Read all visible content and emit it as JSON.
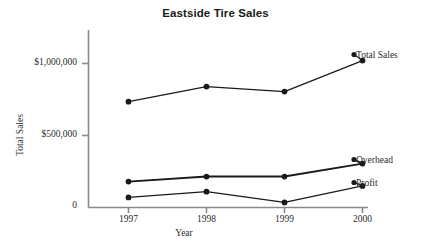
{
  "chart_data": {
    "type": "line",
    "title": "Eastside Tire Sales",
    "xlabel": "Year",
    "ylabel": "Total Sales",
    "categories": [
      "1997",
      "1998",
      "1999",
      "2000"
    ],
    "x": [
      1997,
      1998,
      1999,
      2000
    ],
    "ylim": [
      0,
      1150000
    ],
    "xlim": [
      1996.5,
      2000.4
    ],
    "yticks": [
      0,
      500000,
      1000000
    ],
    "ytick_labels": [
      "0",
      "$500,000",
      "$1,000,000"
    ],
    "grid": false,
    "legend_position": "right-inline-labels",
    "series": [
      {
        "name": "Total Sales",
        "values": [
          735000,
          840000,
          805000,
          1020000
        ],
        "color": "#1a1a1a",
        "line_width": 1.2,
        "marker": "filled-circle"
      },
      {
        "name": "Overhead",
        "values": [
          180000,
          215000,
          215000,
          305000
        ],
        "color": "#1a1a1a",
        "line_width": 1.9,
        "marker": "filled-circle"
      },
      {
        "name": "Profit",
        "values": [
          70000,
          110000,
          35000,
          150000
        ],
        "color": "#1a1a1a",
        "line_width": 1.2,
        "marker": "filled-circle"
      }
    ]
  },
  "title": "Eastside Tire Sales",
  "axes": {
    "y_title": "Total Sales",
    "x_title": "Year",
    "y_ticks": [
      {
        "label": "$1,000,000",
        "value": 1000000
      },
      {
        "label": "$500,000",
        "value": 500000
      },
      {
        "label": "0",
        "value": 0
      }
    ],
    "x_ticks": [
      {
        "label": "1997"
      },
      {
        "label": "1998"
      },
      {
        "label": "1999"
      },
      {
        "label": "2000"
      }
    ]
  },
  "series_labels": [
    {
      "label": "Total Sales"
    },
    {
      "label": "Overhead"
    },
    {
      "label": "Profit"
    }
  ],
  "colors": {
    "line": "#1a1a1a",
    "axis": "#8a8a8a",
    "text": "#2b2b2b",
    "title": "#1a1a1a",
    "background": "#ffffff"
  }
}
